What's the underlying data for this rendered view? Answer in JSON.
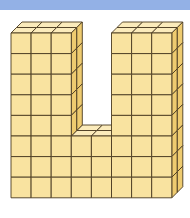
{
  "header": {
    "band_color": "#93B1E6"
  },
  "figure": {
    "shape": "U",
    "width_cubes": 8,
    "height_cubes": 8,
    "depth_cubes": 2,
    "left_tower": {
      "columns": 3,
      "rows": 8
    },
    "right_tower": {
      "columns": 3,
      "rows": 8
    },
    "gap": {
      "columns": 2,
      "rows_removed": 5,
      "rows_remaining": 3
    },
    "colors": {
      "front": "#F9E3A0",
      "side": "#EECB70",
      "top": "#FBEBBB",
      "edge": "#4A3A20"
    }
  }
}
